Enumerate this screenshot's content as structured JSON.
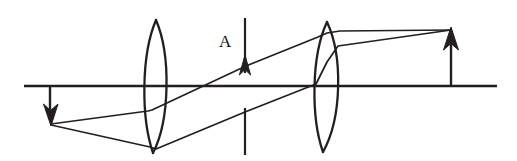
{
  "figure": {
    "kind": "ray-diagram",
    "width": 517,
    "height": 161,
    "background": "#ffffff",
    "stroke_color": "#231f20",
    "labels": [
      {
        "id": "A",
        "text": "A",
        "x": 219,
        "y": 33,
        "refers_to": "object-arrow"
      }
    ],
    "optical_axis": {
      "name": "optical-axis",
      "x1": 24,
      "y1": 86,
      "x2": 497,
      "y2": 86,
      "stroke_width": 2.6
    },
    "lenses": [
      {
        "name": "lens-1",
        "type": "biconvex",
        "center_x": 156,
        "top_y": 20,
        "bottom_y": 153,
        "half_width": 10.5,
        "stroke_width": 2.2
      },
      {
        "name": "lens-2",
        "type": "biconvex",
        "center_x": 327,
        "top_y": 22,
        "bottom_y": 152,
        "half_width": 11,
        "stroke_width": 2.2
      }
    ],
    "object_arrow": {
      "name": "object-arrow",
      "label": "A",
      "direction": "up",
      "x": 245,
      "tail_y": 18,
      "tip_y": 56,
      "head_base_y": 73,
      "head_half_width": 5.5,
      "stroke_width": 2.2
    },
    "object_marker_below_axis": {
      "name": "object-axis-marker",
      "x": 245,
      "y1": 108,
      "y2": 155,
      "stroke_width": 2.2
    },
    "intermediate_image_arrow": {
      "name": "intermediate-image-arrow",
      "direction": "down",
      "x": 50,
      "tail_y": 86,
      "tip_y": 125,
      "head_base_y": 108,
      "head_half_width": 6.5,
      "stroke_width": 2.2
    },
    "final_image_arrow": {
      "name": "final-image-arrow",
      "direction": "up",
      "x": 451,
      "tail_y": 86,
      "tip_y": 28,
      "head_base_y": 46,
      "head_half_width": 6.5,
      "stroke_width": 2.2
    },
    "rays": [
      {
        "name": "ray-upper",
        "points": [
          [
            51,
            124
          ],
          [
            156,
            110
          ],
          [
            246,
            66
          ],
          [
            327,
            30
          ],
          [
            451,
            30
          ]
        ],
        "stroke_width": 1.7
      },
      {
        "name": "ray-lower",
        "points": [
          [
            51,
            125
          ],
          [
            153,
            148
          ],
          [
            245,
            111
          ],
          [
            327,
            46
          ],
          [
            451,
            30
          ]
        ],
        "stroke_width": 1.7
      }
    ]
  }
}
